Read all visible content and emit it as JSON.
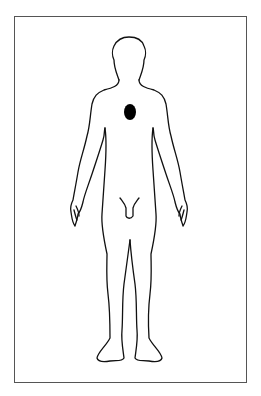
{
  "diagram": {
    "type": "body-chart",
    "view": "front",
    "figure": "human-body-outline",
    "markers": [
      {
        "name": "chest-mark",
        "shape": "oval",
        "color": "#000000",
        "cx": 130,
        "cy": 112,
        "rx": 6,
        "ry": 8
      }
    ],
    "colors": {
      "outline": "#111111",
      "frame": "#555555",
      "background": "#ffffff"
    }
  }
}
